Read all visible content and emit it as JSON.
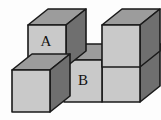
{
  "figure": {
    "background_color": "#fdfdfd",
    "cube_count": 5,
    "labels": [
      {
        "id": "label-a",
        "text": "A",
        "cube": "upper-left-cube",
        "x": 46,
        "y": 42
      },
      {
        "id": "label-b",
        "text": "B",
        "cube": "lower-middle-cube",
        "x": 83,
        "y": 81
      }
    ],
    "colors": {
      "top_face": "#9c9c9c",
      "front_face": "#c9c9c9",
      "side_face": "#6f6f6f",
      "edge": "#1a1a1a",
      "label_text": "#111111",
      "frame": "#d8d8d8"
    },
    "projection": {
      "type": "oblique",
      "cube_width": 46,
      "cube_height": 42,
      "depth_dx": 20,
      "depth_dy": -16
    },
    "cubes": [
      {
        "name": "upper-left-cube",
        "label": "A",
        "position": "top row, left column",
        "front_face": "28,25 66,25 66,67 28,67",
        "top_face": "28,25 48,9 86,9 66,25",
        "side_face": "66,25 86,9 86,51 66,67"
      },
      {
        "name": "upper-right-cube",
        "label": "",
        "position": "top row, right column",
        "front_face": "102,25 140,25 140,67 102,67",
        "top_face": "102,25 122,9 160,9 140,25",
        "side_face": "140,25 160,9 160,51 140,67"
      },
      {
        "name": "lower-middle-cube",
        "label": "B",
        "position": "bottom row, middle column",
        "front_face": "64,60 102,60 102,102 64,102",
        "top_face": "64,60 84,44 122,44 102,60",
        "side_face": "102,60 122,44 122,86 102,102"
      },
      {
        "name": "lower-right-cube",
        "label": "",
        "position": "bottom row, right column",
        "front_face": "102,60 140,60 140,102 102,102",
        "top_face": "102,60 122,44 160,44 140,60",
        "side_face": "140,60 160,44 160,86 140,102"
      },
      {
        "name": "front-left-cube",
        "label": "",
        "position": "front row, left column (protruding toward viewer)",
        "front_face": "12,70 50,70 50,112 12,112",
        "top_face": "12,70 32,54 70,54 50,70",
        "side_face": "50,70 70,54 70,96 50,112"
      }
    ],
    "notch": {
      "name": "gap-between-top-cubes",
      "description": "Open notch between the two upper cubes exposing the top face of the lower middle cube.",
      "polygon": "66,25 86,9 102,9 102,60 66,60"
    }
  }
}
